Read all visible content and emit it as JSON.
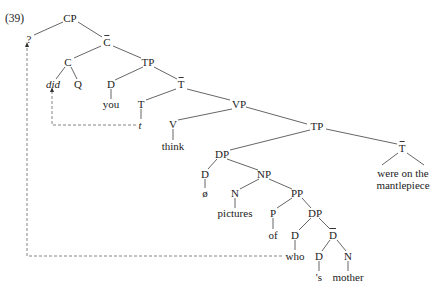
{
  "example_number": "(39)",
  "nodes": {
    "cp": "CP",
    "q_mark": "?",
    "cbar": "C",
    "c": "C",
    "tp1": "TP",
    "did": "did",
    "q": "Q",
    "d_you": "D",
    "tbar1": "T",
    "you": "you",
    "t": "T",
    "vp": "VP",
    "trace": "t",
    "v": "V",
    "think": "think",
    "tp2": "TP",
    "dp1": "DP",
    "tbar2": "T",
    "d_null": "D",
    "np": "NP",
    "were_line1": "were on the",
    "were_line2": "mantlepiece",
    "null": "ø",
    "n_pictures": "N",
    "pp": "PP",
    "pictures": "pictures",
    "p": "P",
    "dp2": "DP",
    "of": "of",
    "d_who": "D",
    "dbar": "D",
    "who": "who",
    "d_s": "D",
    "n_mother": "N",
    "s": "'s",
    "mother": "mother"
  },
  "colors": {
    "line": "#555555",
    "dashed": "#777777",
    "text": "#222222"
  }
}
